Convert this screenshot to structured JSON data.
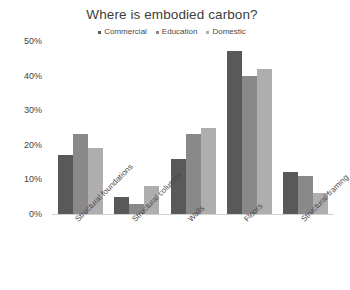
{
  "chart_data": {
    "type": "bar",
    "title": "Where is embodied carbon?",
    "xlabel": "",
    "ylabel": "",
    "ylim": [
      0,
      50
    ],
    "ytick_labels": [
      "50%",
      "40%",
      "30%",
      "20%",
      "10%",
      "0%"
    ],
    "ytick_values": [
      50,
      40,
      30,
      20,
      10,
      0
    ],
    "grid": false,
    "legend_position": "top-center",
    "categories": [
      "Structural foundations",
      "Structural columns",
      "Walls",
      "Floors",
      "Structural framing"
    ],
    "series": [
      {
        "name": "Commercial",
        "color": "#595959",
        "values": [
          17,
          5,
          16,
          47,
          12
        ]
      },
      {
        "name": "Education",
        "color": "#898989",
        "values": [
          23,
          3,
          23,
          40,
          11
        ]
      },
      {
        "name": "Domestic",
        "color": "#aeaeae",
        "values": [
          19,
          8,
          25,
          42,
          6
        ]
      }
    ]
  },
  "colors": {
    "background": "#ffffff",
    "text": "#3f3f3f",
    "axis": "#d0d0d0"
  }
}
